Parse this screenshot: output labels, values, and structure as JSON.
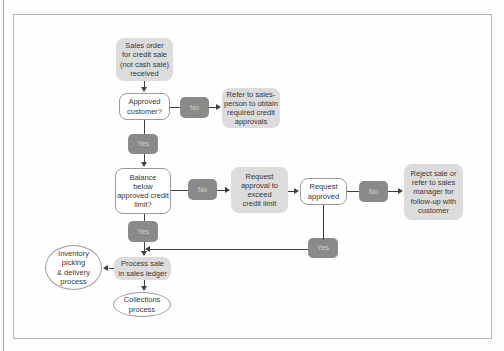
{
  "colors": {
    "page_bg": "#fdfdfd",
    "frame_bg": "#fefefe",
    "frame_border": "#b8b8b8",
    "page_edge": "#ababab",
    "box_light": "#dcdcdc",
    "box_white": "#ffffff",
    "box_dark": "#8a8a8a",
    "box_dark_text": "#cfcfcf",
    "node_border": "#9b9b9b",
    "line": "#404040",
    "text": "#383838"
  },
  "flowchart": {
    "nodes": {
      "sales_order": {
        "label": "Sales order\nfor credit sale\n(not cash sale)\nreceived"
      },
      "approved_customer": {
        "label": "Approved\ncustomer?"
      },
      "no_1": {
        "label": "No"
      },
      "refer_salesperson": {
        "label": "Refer to sales-\nperson to obtain\nrequired credit\napprovals"
      },
      "yes_1": {
        "label": "Yes"
      },
      "balance_below": {
        "label": "Balance\nbelow\napproved credit\nlimit?"
      },
      "no_2": {
        "label": "No"
      },
      "request_approval": {
        "label": "Request\napproval to\nexceed\ncredit limit"
      },
      "request_approved": {
        "label": "Request\napproved"
      },
      "no_3": {
        "label": "No"
      },
      "reject_sale": {
        "label": "Reject sale or\nrefer to sales\nmanager for\nfollow-up with\ncustomer"
      },
      "yes_2": {
        "label": "Yes"
      },
      "yes_3": {
        "label": "Yes"
      },
      "process_sale": {
        "label": "Process sale\nin sales ledger"
      },
      "inventory_picking": {
        "label": "Inventory\npicking\n& delivery\nprocess"
      },
      "collections": {
        "label": "Collections\nprocess"
      }
    }
  }
}
